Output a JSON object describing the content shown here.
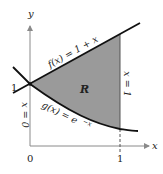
{
  "figure": {
    "type": "area-between-curves",
    "region_label": "R",
    "region_color": "#9a9a9a",
    "curve_color": "#111111",
    "axis_color": "#8a8a8a",
    "axes": {
      "x_label": "x",
      "y_label": "y",
      "x_ticks": [
        {
          "value": 0,
          "label": "0"
        },
        {
          "value": 1,
          "label": "1"
        }
      ],
      "y_ticks": [
        {
          "value": 1,
          "label": "1"
        }
      ]
    },
    "curves": [
      {
        "name": "f",
        "label": "f(x) = 1 + x",
        "expression": "1 + x"
      },
      {
        "name": "g",
        "label": "g(x) = e^−x",
        "label_base": "g(x) = e",
        "label_exp": "−x",
        "expression": "e^(-x)"
      }
    ],
    "boundaries": [
      {
        "label": "x = 0"
      },
      {
        "label": "x = 1"
      }
    ]
  }
}
